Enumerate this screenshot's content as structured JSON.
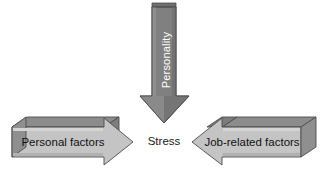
{
  "diagram": {
    "background_color": "#ffffff",
    "nodes": {
      "center": {
        "label": "Stress",
        "text_color": "#1a1a1a"
      }
    },
    "arrows": [
      {
        "id": "personality-arrow",
        "label": "Personality",
        "direction": "down",
        "text_orientation": "rotated-90-ccw",
        "fill_color": "#7f7f7f",
        "shade_color": "#6b6b6b",
        "highlight_color": "#999999",
        "outline_color": "#4d4d4d",
        "text_color": "#ffffff"
      },
      {
        "id": "personal-factors-arrow",
        "label": "Personal factors",
        "direction": "right",
        "text_orientation": "horizontal",
        "fill_color": "#c4c4c4",
        "shade_color": "#8f8f8f",
        "highlight_color": "#d8d8d8",
        "outline_color": "#4d4d4d",
        "text_color": "#111111"
      },
      {
        "id": "job-related-factors-arrow",
        "label": "Job-related factors",
        "direction": "left",
        "text_orientation": "horizontal",
        "fill_color": "#c4c4c4",
        "shade_color": "#8f8f8f",
        "highlight_color": "#d8d8d8",
        "outline_color": "#4d4d4d",
        "text_color": "#111111"
      }
    ]
  }
}
